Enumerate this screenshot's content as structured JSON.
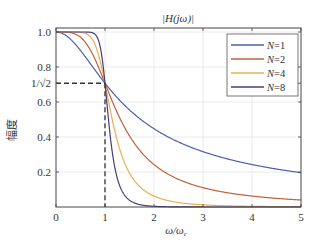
{
  "chart_data": {
    "type": "line",
    "title": "|H(jω)|",
    "xlabel": "ω/ωc",
    "ylabel": "幅度",
    "xlim": [
      0,
      5
    ],
    "ylim": [
      0,
      1.0
    ],
    "grid": true,
    "legend_position": "upper right",
    "x_ticks": [
      "0",
      "1",
      "2",
      "3",
      "4",
      "5"
    ],
    "y_ticks": [
      "0.2",
      "0.4",
      "0.6",
      "1/√2",
      "0.8",
      "1.0"
    ],
    "annotations": [
      {
        "type": "dashed-line",
        "description": "horizontal at 1/√2 from x=0 to x=1"
      },
      {
        "type": "dashed-line",
        "description": "vertical at x=1 from y=0 to y=1/√2"
      }
    ],
    "formula": "|H| = 1/sqrt(1 + (ω/ωc)^(2N))",
    "series": [
      {
        "name": "N=1",
        "N": 1,
        "color": "#4a5fb0",
        "values_at": {
          "0": 1.0,
          "1": 0.707,
          "2": 0.447,
          "3": 0.316,
          "4": 0.243,
          "5": 0.196
        }
      },
      {
        "name": "N=2",
        "N": 2,
        "color": "#c0603c",
        "values_at": {
          "0": 1.0,
          "1": 0.707,
          "2": 0.243,
          "3": 0.11,
          "4": 0.062,
          "5": 0.04
        }
      },
      {
        "name": "N=4",
        "N": 4,
        "color": "#e8b050",
        "values_at": {
          "0": 1.0,
          "1": 0.707,
          "2": 0.062,
          "3": 0.012,
          "4": 0.004,
          "5": 0.002
        }
      },
      {
        "name": "N=8",
        "N": 8,
        "color": "#4a3a80",
        "values_at": {
          "0": 1.0,
          "1": 0.707,
          "2": 0.004,
          "3": 0.0,
          "4": 0.0,
          "5": 0.0
        }
      }
    ]
  }
}
